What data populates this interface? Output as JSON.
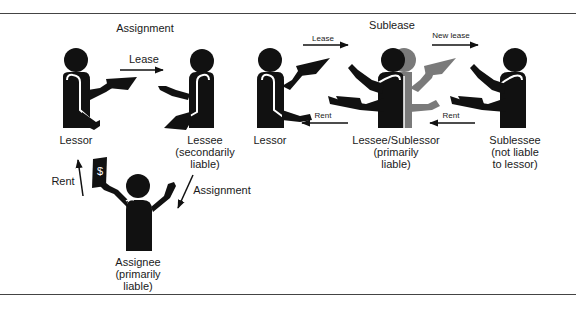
{
  "diagram": {
    "header_partial": "",
    "assignment": {
      "title": "Assignment",
      "lease_arrow_label": "Lease",
      "rent_arrow_label": "Rent",
      "assignment_arrow_label": "Assignment",
      "lessor": {
        "label": "Lessor"
      },
      "lessee": {
        "line1": "Lessee",
        "line2": "(secondarily",
        "line3": "liable)"
      },
      "assignee": {
        "line1": "Assignee",
        "line2": "(primarily",
        "line3": "liable)"
      }
    },
    "sublease": {
      "title": "Sublease",
      "lease_arrow_label": "Lease",
      "new_lease_arrow_label": "New lease",
      "rent_arrow_label_left": "Rent",
      "rent_arrow_label_right": "Rent",
      "lessor": {
        "label": "Lessor"
      },
      "lessee_sublessor": {
        "line1": "Lessee/Sublessor",
        "line2": "(primarily",
        "line3": "liable)"
      },
      "sublessee": {
        "line1": "Sublessee",
        "line2": "(not liable",
        "line3": "to lessor)"
      }
    },
    "icons": {
      "bill_symbol": "$"
    },
    "colors": {
      "figure": "#111111",
      "ghost_figure": "#7a7a7a",
      "rule": "#444444",
      "text": "#1a1a1a"
    }
  }
}
